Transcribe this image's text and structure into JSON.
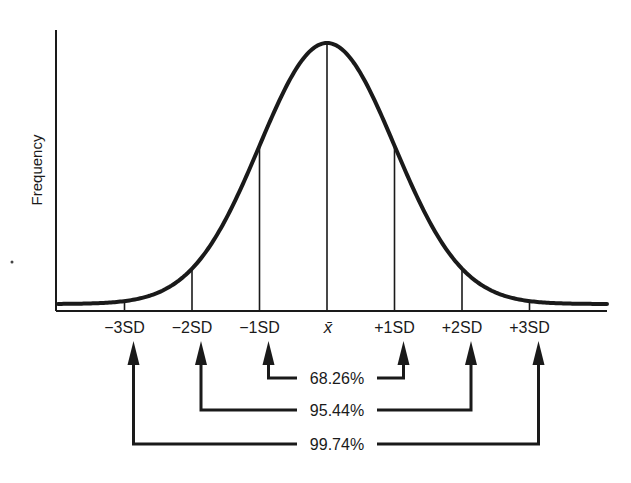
{
  "chart_data": {
    "type": "line",
    "title": "",
    "xlabel": "",
    "ylabel": "Frequency",
    "distribution": "normal",
    "mean": 0,
    "sd": 1,
    "xlim": [
      -4,
      4.2
    ],
    "grid": false,
    "ticks": [
      {
        "sd": -3,
        "label": "−3SD"
      },
      {
        "sd": -2,
        "label": "−2SD"
      },
      {
        "sd": -1,
        "label": "−1SD"
      },
      {
        "sd": 0,
        "label": "x̄"
      },
      {
        "sd": 1,
        "label": "+1SD"
      },
      {
        "sd": 2,
        "label": "+2SD"
      },
      {
        "sd": 3,
        "label": "+3SD"
      }
    ],
    "intervals": [
      {
        "from_sd": -1,
        "to_sd": 1,
        "percent": 68.26,
        "label": "68.26%"
      },
      {
        "from_sd": -2,
        "to_sd": 2,
        "percent": 95.44,
        "label": "95.44%"
      },
      {
        "from_sd": -3,
        "to_sd": 3,
        "percent": 99.74,
        "label": "99.74%"
      }
    ],
    "colors": {
      "ink": "#1a1a1a",
      "background": "#ffffff"
    }
  }
}
